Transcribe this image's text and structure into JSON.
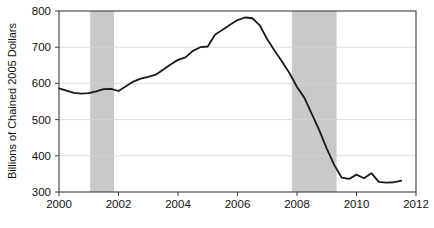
{
  "chart_data": {
    "type": "line",
    "title": "",
    "xlabel": "",
    "ylabel": "Billions of Chained 2005 Dollars",
    "xlim": [
      2000,
      2012
    ],
    "ylim": [
      300,
      800
    ],
    "xticks": [
      2000,
      2002,
      2004,
      2006,
      2008,
      2010,
      2012
    ],
    "xtick_labels": [
      "2000",
      "2002",
      "2004",
      "2006",
      "2008",
      "2010",
      "2012"
    ],
    "yticks": [
      300,
      400,
      500,
      600,
      700,
      800
    ],
    "ytick_labels": [
      "300",
      "400",
      "500",
      "600",
      "700",
      "800"
    ],
    "grid": "horizontal",
    "legend": "none",
    "line_color": "#1a1a1a",
    "line_width": 1.8,
    "shaded_color": "#c9c9c9",
    "shaded_regions": [
      {
        "name": "recession-2001",
        "x0": 2001.05,
        "x1": 2001.85
      },
      {
        "name": "recession-2008",
        "x0": 2007.83,
        "x1": 2009.33
      }
    ],
    "series": [
      {
        "name": "Residential Fixed Investment",
        "x": [
          2000.0,
          2000.25,
          2000.5,
          2000.75,
          2001.0,
          2001.25,
          2001.5,
          2001.75,
          2002.0,
          2002.25,
          2002.5,
          2002.75,
          2003.0,
          2003.25,
          2003.5,
          2003.75,
          2004.0,
          2004.25,
          2004.5,
          2004.75,
          2005.0,
          2005.25,
          2005.5,
          2005.75,
          2006.0,
          2006.25,
          2006.5,
          2006.75,
          2007.0,
          2007.25,
          2007.5,
          2007.75,
          2008.0,
          2008.25,
          2008.5,
          2008.75,
          2009.0,
          2009.25,
          2009.5,
          2009.75,
          2010.0,
          2010.25,
          2010.5,
          2010.75,
          2011.0,
          2011.25,
          2011.5
        ],
        "y": [
          586,
          580,
          574,
          572,
          573,
          578,
          584,
          585,
          579,
          592,
          605,
          613,
          618,
          624,
          638,
          652,
          665,
          672,
          690,
          700,
          702,
          735,
          748,
          762,
          775,
          782,
          780,
          760,
          722,
          690,
          660,
          628,
          590,
          560,
          515,
          470,
          420,
          375,
          340,
          336,
          348,
          338,
          352,
          328,
          326,
          327,
          331
        ]
      }
    ]
  },
  "axis": {
    "y_label": "Billions of Chained 2005 Dollars"
  }
}
